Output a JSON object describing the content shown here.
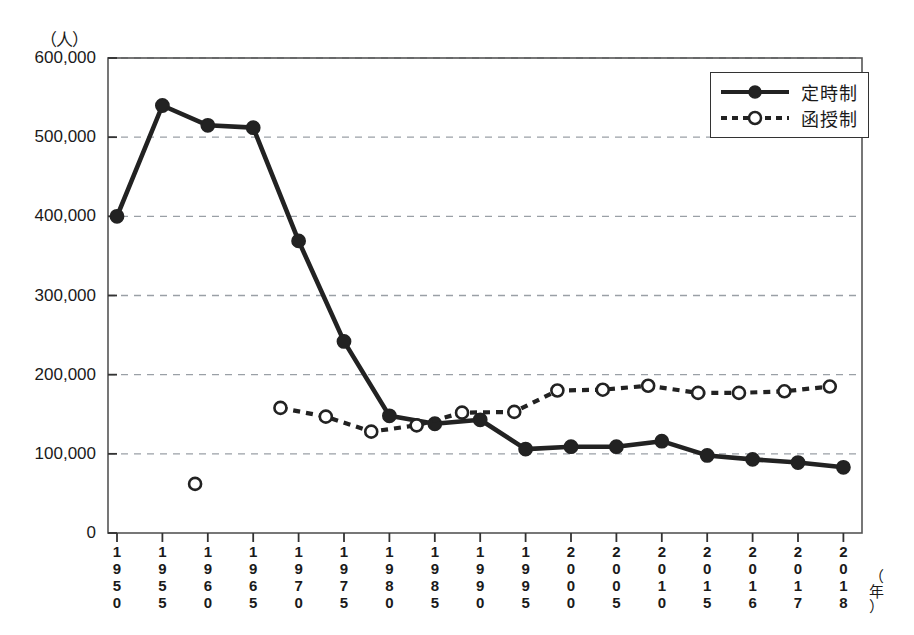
{
  "chart_data": {
    "type": "line",
    "title": "",
    "ylabel": "（人）",
    "xlabel": "（年）",
    "ylim": [
      0,
      600000
    ],
    "y_ticks": [
      0,
      100000,
      200000,
      300000,
      400000,
      500000,
      600000
    ],
    "y_tick_labels": [
      "0",
      "100,000",
      "200,000",
      "300,000",
      "400,000",
      "500,000",
      "600,000"
    ],
    "grid": "horizontal-dashed",
    "legend_position": "top-right",
    "categories": [
      "1950",
      "1955",
      "1960",
      "1965",
      "1970",
      "1975",
      "1980",
      "1985",
      "1990",
      "1995",
      "2000",
      "2005",
      "2010",
      "2015",
      "2016",
      "2017",
      "2018"
    ],
    "x_positions": [
      0,
      1,
      2,
      3,
      4,
      5,
      6,
      7,
      8,
      9,
      10,
      11,
      12,
      13,
      14,
      15,
      16
    ],
    "series": [
      {
        "name": "定時制",
        "style": "solid",
        "marker": "filled-circle",
        "color": "#222222",
        "x": [
          0,
          1,
          2,
          3,
          4,
          5,
          6,
          7,
          8,
          9,
          10,
          11,
          12,
          13,
          14,
          15,
          16
        ],
        "values": [
          400000,
          540000,
          515000,
          512000,
          369000,
          242000,
          148000,
          138000,
          143000,
          106000,
          109000,
          109000,
          116000,
          98000,
          93000,
          89000,
          83000
        ]
      },
      {
        "name": "函授制",
        "style": "dashed",
        "marker": "open-circle",
        "color": "#222222",
        "x": [
          1.72,
          3.6,
          4.6,
          5.6,
          6.6,
          7.6,
          8.75,
          9.7,
          10.7,
          11.7,
          12.8,
          13.7,
          14.7,
          15.7
        ],
        "values": [
          62000,
          158000,
          147000,
          128000,
          136000,
          152000,
          153000,
          180000,
          181000,
          186000,
          177000,
          177000,
          179000,
          185000
        ],
        "note": "first marker at 1958 is isolated (no connecting line)"
      }
    ]
  },
  "legend": {
    "items": [
      {
        "label": "定時制",
        "style": "solid",
        "marker": "filled-circle"
      },
      {
        "label": "函授制",
        "style": "dashed",
        "marker": "open-circle"
      }
    ]
  },
  "axis": {
    "y_unit": "（人）",
    "x_unit_chars": [
      "（",
      "年",
      "）"
    ]
  }
}
